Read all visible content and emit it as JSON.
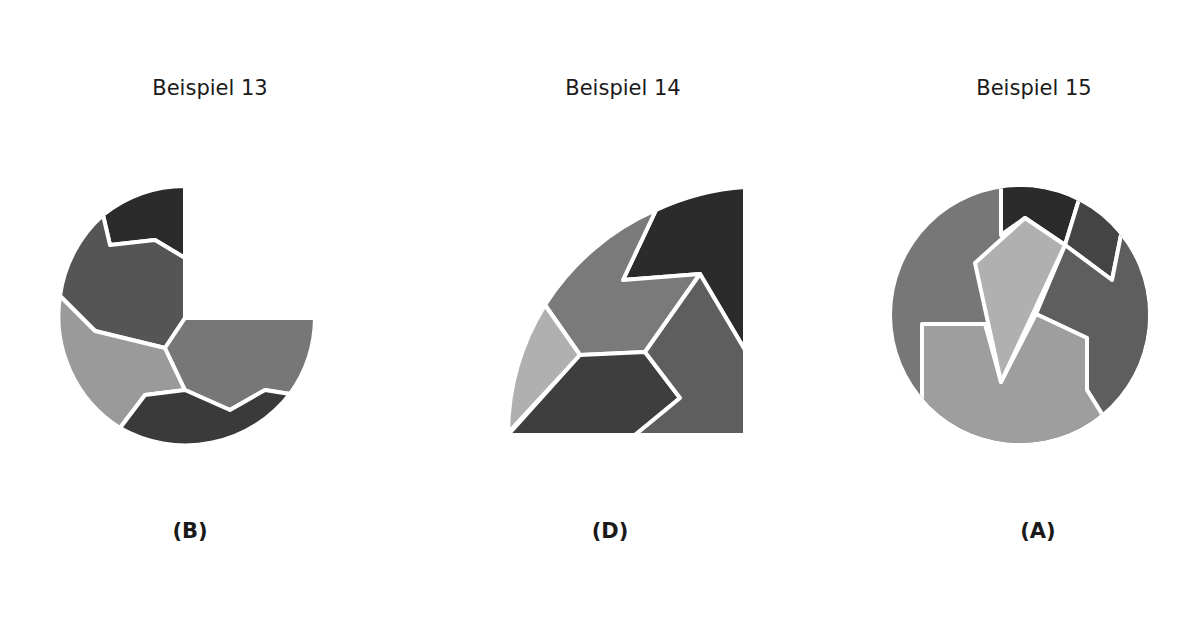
{
  "examples": [
    {
      "title": "Beispiel 13",
      "answer": "(B)",
      "shape": "three-quarter-circle"
    },
    {
      "title": "Beispiel 14",
      "answer": "(D)",
      "shape": "quarter-circle"
    },
    {
      "title": "Beispiel 15",
      "answer": "(A)",
      "shape": "full-circle"
    }
  ],
  "colors": {
    "darkest": "#2b2b2b",
    "dark": "#4a4a4a",
    "medium": "#6e6e6e",
    "light": "#9a9a9a",
    "lightest": "#b5b5b5",
    "separator": "#ffffff"
  }
}
